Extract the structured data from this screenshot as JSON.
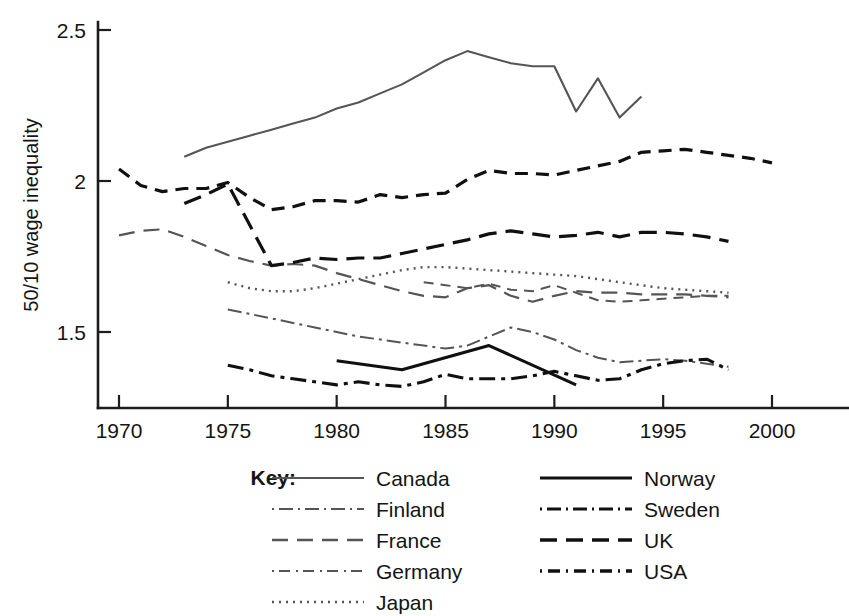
{
  "chart_data": {
    "type": "line",
    "title": "",
    "xlabel": "",
    "ylabel": "50/10 wage inequality",
    "xlim": [
      1969,
      2001
    ],
    "ylim": [
      1.28,
      2.55
    ],
    "xticks": [
      1970,
      1975,
      1980,
      1985,
      1990,
      1995,
      2000
    ],
    "yticks": [
      1.5,
      2,
      2.5
    ],
    "xtick_labels": [
      "1970",
      "1975",
      "1980",
      "1985",
      "1990",
      "1995",
      "2000"
    ],
    "ytick_labels": [
      "1.5",
      "2",
      "2.5"
    ],
    "grid": false,
    "legend_position": "below-center",
    "legend_title": "Key:",
    "series": [
      {
        "name": "Canada",
        "style": "solid",
        "color": "#555555",
        "width": 2.1,
        "dash": "",
        "x": [
          1973,
          1974,
          1975,
          1976,
          1977,
          1978,
          1979,
          1980,
          1981,
          1982,
          1983,
          1984,
          1985,
          1986,
          1987,
          1988,
          1989,
          1990,
          1991,
          1992,
          1993,
          1994
        ],
        "y": [
          2.08,
          2.11,
          2.13,
          2.15,
          2.17,
          2.19,
          2.21,
          2.24,
          2.26,
          2.29,
          2.32,
          2.36,
          2.4,
          2.43,
          2.41,
          2.39,
          2.38,
          2.38,
          2.23,
          2.34,
          2.21,
          2.28
        ]
      },
      {
        "name": "Finland",
        "style": "dash-dot",
        "color": "#555555",
        "width": 2.0,
        "dash": "14,5,3,5",
        "x": [
          1975,
          1976,
          1977,
          1978,
          1979,
          1980,
          1981,
          1982,
          1983,
          1984,
          1985,
          1986,
          1987,
          1988,
          1989,
          1990,
          1991,
          1992,
          1993,
          1994,
          1995,
          1996,
          1997,
          1998
        ],
        "y": [
          1.575,
          1.56,
          1.545,
          1.53,
          1.515,
          1.5,
          1.485,
          1.475,
          1.465,
          1.455,
          1.445,
          1.455,
          1.485,
          1.515,
          1.5,
          1.475,
          1.44,
          1.415,
          1.4,
          1.405,
          1.41,
          1.405,
          1.395,
          1.385
        ]
      },
      {
        "name": "France",
        "style": "dash",
        "color": "#555555",
        "width": 2.2,
        "dash": "16,9",
        "x": [
          1970,
          1971,
          1972,
          1973,
          1974,
          1975,
          1976,
          1977,
          1978,
          1979,
          1980,
          1981,
          1982,
          1983,
          1984,
          1985,
          1986,
          1987,
          1988,
          1989,
          1990,
          1991,
          1992,
          1993,
          1994,
          1995,
          1996,
          1997,
          1998
        ],
        "y": [
          1.82,
          1.835,
          1.84,
          1.815,
          1.785,
          1.755,
          1.735,
          1.72,
          1.725,
          1.72,
          1.695,
          1.675,
          1.655,
          1.635,
          1.62,
          1.615,
          1.645,
          1.655,
          1.62,
          1.6,
          1.62,
          1.635,
          1.63,
          1.63,
          1.625,
          1.625,
          1.625,
          1.62,
          1.615
        ]
      },
      {
        "name": "Germany",
        "style": "small-dash",
        "color": "#555555",
        "width": 2.0,
        "dash": "10,7",
        "x": [
          1984,
          1985,
          1986,
          1987,
          1988,
          1989,
          1990,
          1991,
          1992,
          1993,
          1994,
          1995,
          1996,
          1997,
          1998
        ],
        "y": [
          1.665,
          1.655,
          1.645,
          1.66,
          1.64,
          1.635,
          1.655,
          1.63,
          1.605,
          1.6,
          1.605,
          1.61,
          1.615,
          1.62,
          1.62
        ]
      },
      {
        "name": "Japan",
        "style": "dotted",
        "color": "#555555",
        "width": 2.4,
        "dash": "2,5",
        "x": [
          1975,
          1976,
          1977,
          1978,
          1979,
          1980,
          1981,
          1982,
          1983,
          1984,
          1985,
          1986,
          1987,
          1988,
          1989,
          1990,
          1991,
          1992,
          1993,
          1994,
          1995,
          1996,
          1997,
          1998
        ],
        "y": [
          1.665,
          1.645,
          1.635,
          1.635,
          1.645,
          1.66,
          1.675,
          1.69,
          1.705,
          1.715,
          1.715,
          1.71,
          1.705,
          1.7,
          1.695,
          1.69,
          1.685,
          1.675,
          1.665,
          1.655,
          1.645,
          1.64,
          1.635,
          1.63
        ]
      },
      {
        "name": "Norway",
        "style": "solid",
        "color": "#101010",
        "width": 3.1,
        "dash": "",
        "x": [
          1980,
          1983,
          1987,
          1991
        ],
        "y": [
          1.405,
          1.375,
          1.455,
          1.325
        ]
      },
      {
        "name": "Sweden",
        "style": "dash-dot",
        "color": "#101010",
        "width": 3.1,
        "dash": "16,6,4,6",
        "x": [
          1975,
          1976,
          1977,
          1978,
          1979,
          1980,
          1981,
          1982,
          1983,
          1984,
          1985,
          1986,
          1987,
          1988,
          1989,
          1990,
          1991,
          1992,
          1993,
          1994,
          1995,
          1996,
          1997,
          1998
        ],
        "y": [
          1.39,
          1.375,
          1.355,
          1.345,
          1.335,
          1.325,
          1.335,
          1.325,
          1.32,
          1.335,
          1.36,
          1.345,
          1.345,
          1.345,
          1.355,
          1.37,
          1.355,
          1.34,
          1.345,
          1.375,
          1.395,
          1.405,
          1.41,
          1.375
        ]
      },
      {
        "name": "UK",
        "style": "dash",
        "color": "#101010",
        "width": 3.2,
        "dash": "18,9",
        "x": [
          1973,
          1974,
          1975,
          1976,
          1977,
          1978,
          1979,
          1980,
          1981,
          1982,
          1983,
          1984,
          1985,
          1986,
          1987,
          1988,
          1989,
          1990,
          1991,
          1992,
          1993,
          1994,
          1995,
          1996,
          1997,
          1998
        ],
        "y": [
          1.925,
          1.955,
          1.99,
          1.855,
          1.72,
          1.73,
          1.745,
          1.74,
          1.745,
          1.745,
          1.76,
          1.775,
          1.79,
          1.805,
          1.825,
          1.835,
          1.825,
          1.815,
          1.82,
          1.83,
          1.815,
          1.83,
          1.83,
          1.825,
          1.815,
          1.8
        ]
      },
      {
        "name": "USA",
        "style": "small-dash",
        "color": "#101010",
        "width": 3.2,
        "dash": "13,8",
        "x": [
          1970,
          1971,
          1972,
          1973,
          1974,
          1975,
          1976,
          1977,
          1978,
          1979,
          1980,
          1981,
          1982,
          1983,
          1984,
          1985,
          1986,
          1987,
          1988,
          1989,
          1990,
          1991,
          1992,
          1993,
          1994,
          1995,
          1996,
          1997,
          1998,
          1999,
          2000
        ],
        "y": [
          2.04,
          1.985,
          1.965,
          1.975,
          1.975,
          1.995,
          1.945,
          1.905,
          1.915,
          1.935,
          1.935,
          1.93,
          1.955,
          1.945,
          1.955,
          1.96,
          2.005,
          2.035,
          2.025,
          2.025,
          2.02,
          2.035,
          2.05,
          2.065,
          2.095,
          2.1,
          2.105,
          2.095,
          2.085,
          2.075,
          2.06
        ]
      }
    ]
  },
  "legend": {
    "title": "Key:",
    "columns": [
      {
        "items": [
          {
            "label": "Canada",
            "style": "solid",
            "color": "#555555",
            "width": 2.1,
            "dash": ""
          },
          {
            "label": "Finland",
            "style": "dash-dot",
            "color": "#555555",
            "width": 2.2,
            "dash": "2,5,14,5"
          },
          {
            "label": "France",
            "style": "dash",
            "color": "#555555",
            "width": 2.4,
            "dash": "16,9"
          },
          {
            "label": "Germany",
            "style": "small-dash",
            "color": "#555555",
            "width": 2.2,
            "dash": "2,5,11,6"
          },
          {
            "label": "Japan",
            "style": "dotted",
            "color": "#555555",
            "width": 2.6,
            "dash": "2,5"
          }
        ]
      },
      {
        "items": [
          {
            "label": "Norway",
            "style": "solid",
            "color": "#101010",
            "width": 3.2,
            "dash": ""
          },
          {
            "label": "Sweden",
            "style": "dash-dot",
            "color": "#101010",
            "width": 3.2,
            "dash": "2,5,14,5"
          },
          {
            "label": "UK",
            "style": "dash",
            "color": "#101010",
            "width": 3.4,
            "dash": "17,9"
          },
          {
            "label": "USA",
            "style": "small-dash",
            "color": "#101010",
            "width": 3.4,
            "dash": "2,6,12,6"
          }
        ]
      }
    ]
  },
  "colors": {
    "axis": "#1d1d1d",
    "text": "#141414",
    "background": "#ffffff",
    "series_light": "#555555",
    "series_dark": "#101010"
  }
}
